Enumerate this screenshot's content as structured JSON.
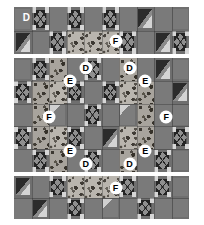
{
  "figure": {
    "background_color": "#ffffff",
    "panel_background": "#6e6e6e"
  },
  "fabric_key": {
    "D": "D",
    "E": "E",
    "F": "F"
  },
  "panels": [
    {
      "id": "top-border",
      "name": "top-border-panel",
      "x": 14,
      "y": 7,
      "width": 175,
      "height": 47,
      "rows": 2,
      "cols": 10,
      "labels": [
        {
          "text": "D",
          "x": 7,
          "y": 22,
          "style": "plain"
        },
        {
          "text": "F",
          "x": 58,
          "y": 73,
          "style": "circle"
        }
      ],
      "cells": [
        {
          "r": 0,
          "c": 0,
          "motif": "plain",
          "fill": "f-bg"
        },
        {
          "r": 0,
          "c": 1,
          "motif": "x",
          "fill": "f-bg"
        },
        {
          "r": 0,
          "c": 2,
          "motif": "plain",
          "fill": "f-med"
        },
        {
          "r": 0,
          "c": 3,
          "motif": "x",
          "fill": "f-bg"
        },
        {
          "r": 0,
          "c": 4,
          "motif": "plain",
          "fill": "f-med"
        },
        {
          "r": 0,
          "c": 5,
          "motif": "x",
          "fill": "f-bg"
        },
        {
          "r": 0,
          "c": 6,
          "motif": "plain",
          "fill": "f-med"
        },
        {
          "r": 0,
          "c": 7,
          "motif": "hst",
          "fill": "f-bg"
        },
        {
          "r": 0,
          "c": 8,
          "motif": "plain",
          "fill": "f-med"
        },
        {
          "r": 0,
          "c": 9,
          "motif": "plain",
          "fill": "f-bg"
        },
        {
          "r": 1,
          "c": 0,
          "motif": "hst",
          "fill": "f-bg"
        },
        {
          "r": 1,
          "c": 1,
          "motif": "plain",
          "fill": "f-med"
        },
        {
          "r": 1,
          "c": 2,
          "motif": "x",
          "fill": "f-bg"
        },
        {
          "r": 1,
          "c": 3,
          "motif": "print",
          "fill": "f-print"
        },
        {
          "r": 1,
          "c": 4,
          "motif": "print",
          "fill": "f-print"
        },
        {
          "r": 1,
          "c": 5,
          "motif": "print",
          "fill": "f-print"
        },
        {
          "r": 1,
          "c": 6,
          "motif": "x",
          "fill": "f-bg"
        },
        {
          "r": 1,
          "c": 7,
          "motif": "plain",
          "fill": "f-med"
        },
        {
          "r": 1,
          "c": 8,
          "motif": "hst",
          "fill": "f-bg"
        },
        {
          "r": 1,
          "c": 9,
          "motif": "x",
          "fill": "f-bg"
        }
      ]
    },
    {
      "id": "center-body",
      "name": "center-body-panel",
      "x": 14,
      "y": 58,
      "width": 175,
      "height": 114,
      "rows": 5,
      "cols": 10,
      "labels": [
        {
          "text": "D",
          "x": 41,
          "y": 9,
          "style": "circle"
        },
        {
          "text": "D",
          "x": 66,
          "y": 9,
          "style": "circle"
        },
        {
          "text": "E",
          "x": 32,
          "y": 20,
          "style": "circle"
        },
        {
          "text": "E",
          "x": 75,
          "y": 20,
          "style": "circle"
        },
        {
          "text": "F",
          "x": 20,
          "y": 52,
          "style": "circle"
        },
        {
          "text": "F",
          "x": 87,
          "y": 52,
          "style": "circle"
        },
        {
          "text": "E",
          "x": 32,
          "y": 82,
          "style": "circle"
        },
        {
          "text": "E",
          "x": 75,
          "y": 82,
          "style": "circle"
        },
        {
          "text": "D",
          "x": 41,
          "y": 93,
          "style": "circle"
        },
        {
          "text": "D",
          "x": 66,
          "y": 93,
          "style": "circle"
        }
      ],
      "cells": [
        {
          "r": 0,
          "c": 0,
          "motif": "plain",
          "fill": "f-bg"
        },
        {
          "r": 0,
          "c": 1,
          "motif": "x",
          "fill": "f-bg"
        },
        {
          "r": 0,
          "c": 2,
          "motif": "print",
          "fill": "f-print2"
        },
        {
          "r": 0,
          "c": 3,
          "motif": "plain",
          "fill": "f-med"
        },
        {
          "r": 0,
          "c": 4,
          "motif": "x",
          "fill": "f-bg"
        },
        {
          "r": 0,
          "c": 5,
          "motif": "plain",
          "fill": "f-med"
        },
        {
          "r": 0,
          "c": 6,
          "motif": "print",
          "fill": "f-print2"
        },
        {
          "r": 0,
          "c": 7,
          "motif": "plain",
          "fill": "f-med"
        },
        {
          "r": 0,
          "c": 8,
          "motif": "hst",
          "fill": "f-bg"
        },
        {
          "r": 0,
          "c": 9,
          "motif": "plain",
          "fill": "f-bg"
        },
        {
          "r": 1,
          "c": 0,
          "motif": "x",
          "fill": "f-bg"
        },
        {
          "r": 1,
          "c": 1,
          "motif": "print",
          "fill": "f-print2"
        },
        {
          "r": 1,
          "c": 2,
          "motif": "print",
          "fill": "f-print"
        },
        {
          "r": 1,
          "c": 3,
          "motif": "x",
          "fill": "f-bg"
        },
        {
          "r": 1,
          "c": 4,
          "motif": "plain",
          "fill": "f-med"
        },
        {
          "r": 1,
          "c": 5,
          "motif": "x",
          "fill": "f-bg"
        },
        {
          "r": 1,
          "c": 6,
          "motif": "print",
          "fill": "f-print"
        },
        {
          "r": 1,
          "c": 7,
          "motif": "print",
          "fill": "f-print2"
        },
        {
          "r": 1,
          "c": 8,
          "motif": "plain",
          "fill": "f-med"
        },
        {
          "r": 1,
          "c": 9,
          "motif": "hst",
          "fill": "f-bg"
        },
        {
          "r": 2,
          "c": 0,
          "motif": "plain",
          "fill": "f-med"
        },
        {
          "r": 2,
          "c": 1,
          "motif": "print",
          "fill": "f-print2"
        },
        {
          "r": 2,
          "c": 2,
          "motif": "wedge",
          "fill": "f-bg"
        },
        {
          "r": 2,
          "c": 3,
          "motif": "plain",
          "fill": "f-med"
        },
        {
          "r": 2,
          "c": 4,
          "motif": "x",
          "fill": "f-bg"
        },
        {
          "r": 2,
          "c": 5,
          "motif": "plain",
          "fill": "f-med"
        },
        {
          "r": 2,
          "c": 6,
          "motif": "wedge",
          "fill": "f-bg"
        },
        {
          "r": 2,
          "c": 7,
          "motif": "print",
          "fill": "f-print2"
        },
        {
          "r": 2,
          "c": 8,
          "motif": "plain",
          "fill": "f-med"
        },
        {
          "r": 2,
          "c": 9,
          "motif": "plain",
          "fill": "f-bg"
        },
        {
          "r": 3,
          "c": 0,
          "motif": "x",
          "fill": "f-bg"
        },
        {
          "r": 3,
          "c": 1,
          "motif": "print",
          "fill": "f-print2"
        },
        {
          "r": 3,
          "c": 2,
          "motif": "print",
          "fill": "f-print"
        },
        {
          "r": 3,
          "c": 3,
          "motif": "x",
          "fill": "f-bg"
        },
        {
          "r": 3,
          "c": 4,
          "motif": "plain",
          "fill": "f-med"
        },
        {
          "r": 3,
          "c": 5,
          "motif": "hst",
          "fill": "f-bg"
        },
        {
          "r": 3,
          "c": 6,
          "motif": "print",
          "fill": "f-print"
        },
        {
          "r": 3,
          "c": 7,
          "motif": "print",
          "fill": "f-print2"
        },
        {
          "r": 3,
          "c": 8,
          "motif": "plain",
          "fill": "f-med"
        },
        {
          "r": 3,
          "c": 9,
          "motif": "x",
          "fill": "f-bg"
        },
        {
          "r": 4,
          "c": 0,
          "motif": "plain",
          "fill": "f-med"
        },
        {
          "r": 4,
          "c": 1,
          "motif": "x",
          "fill": "f-bg"
        },
        {
          "r": 4,
          "c": 2,
          "motif": "print",
          "fill": "f-print2"
        },
        {
          "r": 4,
          "c": 3,
          "motif": "plain",
          "fill": "f-med"
        },
        {
          "r": 4,
          "c": 4,
          "motif": "x",
          "fill": "f-bg"
        },
        {
          "r": 4,
          "c": 5,
          "motif": "plain",
          "fill": "f-med"
        },
        {
          "r": 4,
          "c": 6,
          "motif": "print",
          "fill": "f-print2"
        },
        {
          "r": 4,
          "c": 7,
          "motif": "plain",
          "fill": "f-med"
        },
        {
          "r": 4,
          "c": 8,
          "motif": "x",
          "fill": "f-bg"
        },
        {
          "r": 4,
          "c": 9,
          "motif": "plain",
          "fill": "f-bg"
        }
      ]
    },
    {
      "id": "bottom-border",
      "name": "bottom-border-panel",
      "x": 14,
      "y": 176,
      "width": 175,
      "height": 43,
      "rows": 2,
      "cols": 10,
      "labels": [
        {
          "text": "F",
          "x": 58,
          "y": 27,
          "style": "circle"
        }
      ],
      "cells": [
        {
          "r": 0,
          "c": 0,
          "motif": "hst",
          "fill": "f-bg"
        },
        {
          "r": 0,
          "c": 1,
          "motif": "plain",
          "fill": "f-med"
        },
        {
          "r": 0,
          "c": 2,
          "motif": "x",
          "fill": "f-bg"
        },
        {
          "r": 0,
          "c": 3,
          "motif": "print",
          "fill": "f-print"
        },
        {
          "r": 0,
          "c": 4,
          "motif": "print",
          "fill": "f-print"
        },
        {
          "r": 0,
          "c": 5,
          "motif": "print",
          "fill": "f-print"
        },
        {
          "r": 0,
          "c": 6,
          "motif": "x",
          "fill": "f-bg"
        },
        {
          "r": 0,
          "c": 7,
          "motif": "plain",
          "fill": "f-med"
        },
        {
          "r": 0,
          "c": 8,
          "motif": "x",
          "fill": "f-bg"
        },
        {
          "r": 0,
          "c": 9,
          "motif": "plain",
          "fill": "f-bg"
        },
        {
          "r": 1,
          "c": 0,
          "motif": "plain",
          "fill": "f-med"
        },
        {
          "r": 1,
          "c": 1,
          "motif": "hst",
          "fill": "f-bg"
        },
        {
          "r": 1,
          "c": 2,
          "motif": "plain",
          "fill": "f-med"
        },
        {
          "r": 1,
          "c": 3,
          "motif": "x",
          "fill": "f-bg"
        },
        {
          "r": 1,
          "c": 4,
          "motif": "plain",
          "fill": "f-med"
        },
        {
          "r": 1,
          "c": 5,
          "motif": "wedge",
          "fill": "f-bg"
        },
        {
          "r": 1,
          "c": 6,
          "motif": "plain",
          "fill": "f-med"
        },
        {
          "r": 1,
          "c": 7,
          "motif": "x",
          "fill": "f-bg"
        },
        {
          "r": 1,
          "c": 8,
          "motif": "plain",
          "fill": "f-med"
        },
        {
          "r": 1,
          "c": 9,
          "motif": "plain",
          "fill": "f-bg"
        }
      ]
    }
  ]
}
